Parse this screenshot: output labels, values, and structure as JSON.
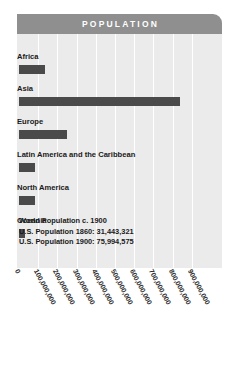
{
  "header": {
    "title": "POPULATION"
  },
  "colors": {
    "header_band": "#8f8f8f",
    "plot_background": "#ebebeb",
    "bar": "#4a4a4a",
    "gridline": "#ffffff",
    "text": "#1a1a1a",
    "page_background": "#ffffff"
  },
  "annotation": {
    "line1": "World Population c. 1900",
    "line2": "U.S. Population 1860: 31,443,321",
    "line3": "U.S. Population 1900: 75,994,575"
  },
  "chart_data": {
    "type": "bar",
    "orientation": "horizontal",
    "title": "POPULATION",
    "xlabel": "",
    "ylabel": "",
    "xlim": [
      0,
      950000000
    ],
    "grid": true,
    "legend": "none",
    "categories": [
      "Africa",
      "Asia",
      "Europe",
      "Latin America and the Caribbean",
      "North America",
      "Oceania"
    ],
    "values": [
      135000000,
      840000000,
      250000000,
      83000000,
      82000000,
      30000000
    ],
    "tick_labels": [
      "0",
      "100,000,000",
      "200,000,000",
      "300,000,000",
      "400,000,000",
      "500,000,000",
      "600,000,000",
      "700,000,000",
      "800,000,000",
      "900,000,000"
    ],
    "tick_values": [
      0,
      100000000,
      200000000,
      300000000,
      400000000,
      500000000,
      600000000,
      700000000,
      800000000,
      900000000
    ],
    "annotations": [
      "World Population c. 1900",
      "U.S. Population 1860: 31,443,321",
      "U.S. Population 1900: 75,994,575"
    ]
  }
}
